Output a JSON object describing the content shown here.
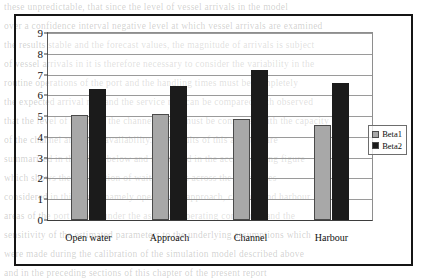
{
  "chart_data": {
    "type": "bar",
    "title": "",
    "subtitle": "",
    "xlabel": "",
    "ylabel": "",
    "categories": [
      "Open water",
      "Approach",
      "Channel",
      "Harbour"
    ],
    "series": [
      {
        "name": "Beta1",
        "color": "#a8a8a8",
        "values": [
          5.05,
          5.1,
          4.85,
          4.55
        ]
      },
      {
        "name": "Beta2",
        "color": "#1b1b1b",
        "values": [
          6.3,
          6.45,
          7.2,
          6.6
        ]
      }
    ],
    "ylim": [
      0,
      9
    ],
    "yticks": [
      0,
      1,
      2,
      3,
      4,
      5,
      6,
      7,
      8,
      9
    ],
    "ytick_labels": [
      "0",
      "1",
      "2",
      "3",
      "4",
      "5",
      "6",
      "7",
      "8",
      "9"
    ],
    "grid": true,
    "grid_axis": "y",
    "legend_position": "right",
    "legend_entries": [
      "Beta1",
      "Beta2"
    ],
    "annotations": []
  },
  "background_text": {
    "note": "faint bleed-through text from reverse of scanned page",
    "lines": [
      "these unpredictable, that since the level of vessel arrivals in the model",
      "over a confidence interval negative level at which vessel arrivals are examined",
      "the results stable and the forecast values, the magnitude of arrivals is subject",
      "of vessel arrivals in it is therefore necessary to consider the variability in the",
      "routine operations of the port and the handling times must be completely",
      "the expected arrival rate and the service rate can be compared with observed",
      "that the level of traffic in the channel queue must be compared with the capacity",
      "of the channel and berth availability. The results of this analysis are",
      "summarised in the tables below and illustrated in the accompanying figure",
      "which shows the distribution of waiting times across the four zones",
      "considered in this study, namely open water, approach, channel and harbour",
      "areas of the port system under the assumed operating conditions and the",
      "sensitivity of the estimated parameters to the underlying assumptions which",
      "were made during the calibration of the simulation model described above",
      "and in the preceding sections of this chapter of the present report"
    ]
  }
}
